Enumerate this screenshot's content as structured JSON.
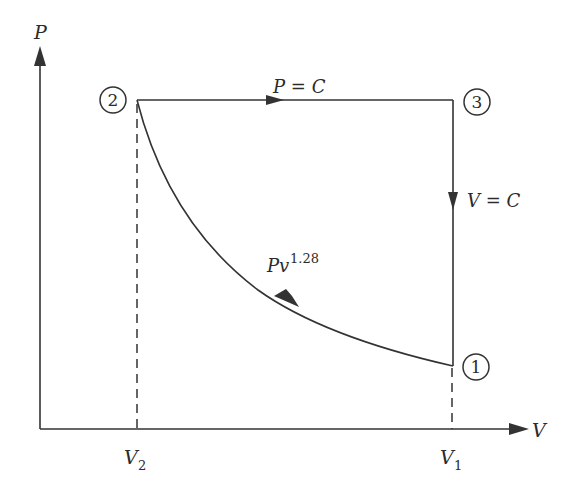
{
  "diagram": {
    "type": "P-V diagram",
    "axes": {
      "y_label": "P",
      "x_label": "V",
      "x_ticks": [
        {
          "main": "V",
          "sub": "2"
        },
        {
          "main": "V",
          "sub": "1"
        }
      ]
    },
    "states": [
      {
        "id": "1",
        "label": "1"
      },
      {
        "id": "2",
        "label": "2"
      },
      {
        "id": "3",
        "label": "3"
      }
    ],
    "processes": [
      {
        "from": "1",
        "to": "2",
        "label_main": "Pv",
        "label_exp": "1.28",
        "kind": "polytropic"
      },
      {
        "from": "2",
        "to": "3",
        "label": "P = C",
        "kind": "isobaric"
      },
      {
        "from": "3",
        "to": "1",
        "label": "V = C",
        "kind": "isochoric"
      }
    ],
    "colors": {
      "line": "#333333",
      "background": "#ffffff"
    }
  }
}
